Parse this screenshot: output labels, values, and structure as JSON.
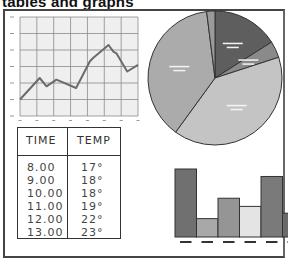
{
  "title": "tables and graphs",
  "table": {
    "headers": [
      "TIME",
      "TEMP"
    ],
    "rows": [
      [
        "8.00",
        "17°"
      ],
      [
        "9.00",
        "18°"
      ],
      [
        "10.00",
        "18°"
      ],
      [
        "11.00",
        "19°"
      ],
      [
        "12.00",
        "22°"
      ],
      [
        "13.00",
        "23°"
      ]
    ]
  },
  "colors": {
    "line": "#6b6b6b",
    "grid": "#8a8a8a",
    "plot_bg": "#efefef",
    "pie_dark": "#5e5e5e",
    "pie_mid": "#9a9a9a",
    "pie_light": "#bdbdbd",
    "pie_lighter": "#c9c9c9"
  },
  "chart_data": [
    {
      "type": "line",
      "title": "",
      "xlabel": "",
      "ylabel": "",
      "grid": true,
      "x": [
        0,
        1,
        1.35,
        1.85,
        2.85,
        3.55,
        3.7,
        4.5,
        4.75,
        4.9,
        5.45,
        6
      ],
      "values": [
        10,
        23,
        18,
        22,
        17,
        33,
        35,
        43,
        39,
        38,
        27,
        31
      ],
      "ylim": [
        0,
        60
      ],
      "xlim": [
        0,
        6
      ]
    },
    {
      "type": "pie",
      "labels": [
        "",
        "",
        "",
        "",
        ""
      ],
      "values": [
        16,
        4,
        40,
        38,
        2
      ],
      "colors": [
        "#5e5e5e",
        "#8a8a8a",
        "#c4c4c4",
        "#ababab",
        "#9a9a9a"
      ]
    },
    {
      "type": "bar",
      "categories": [
        "",
        "",
        "",
        "",
        "",
        ""
      ],
      "values": [
        100,
        27,
        57,
        45,
        89,
        35
      ],
      "colors": [
        "#707070",
        "#a8a8a8",
        "#959595",
        "#e4e4e4",
        "#7a7a7a",
        "#6a6a6a"
      ]
    }
  ]
}
